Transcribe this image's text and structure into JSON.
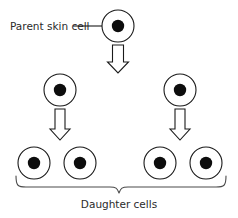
{
  "figure": {
    "title_text": "",
    "width": 238,
    "height": 218,
    "background_color": "#ffffff",
    "stroke_color": "#1a1a1a",
    "nucleus_color": "#0d0d0d",
    "brace_color": "#4a4a4a",
    "text_color": "#2b2b2b"
  },
  "labels": {
    "parent": "Parent skin cell",
    "daughter": "Daughter cells"
  },
  "cells": {
    "parent": {
      "cx": 118,
      "cy": 26,
      "r": 16,
      "nucleus_r": 6.2
    },
    "generation_two": [
      {
        "cx": 60,
        "cy": 90,
        "r": 16,
        "nucleus_r": 6.2
      },
      {
        "cx": 180,
        "cy": 90,
        "r": 16,
        "nucleus_r": 6.2
      }
    ],
    "generation_three": [
      {
        "cx": 34,
        "cy": 163,
        "r": 16,
        "nucleus_r": 6.2
      },
      {
        "cx": 80,
        "cy": 163,
        "r": 16,
        "nucleus_r": 6.2
      },
      {
        "cx": 160,
        "cy": 163,
        "r": 16,
        "nucleus_r": 6.2
      },
      {
        "cx": 206,
        "cy": 163,
        "r": 16,
        "nucleus_r": 6.2
      }
    ]
  },
  "arrows": [
    {
      "name": "parent-to-generation-two",
      "cx": 118,
      "y_top": 45,
      "y_bottom": 73
    },
    {
      "name": "generation-two-left-to-daughters",
      "cx": 60,
      "y_top": 109,
      "y_bottom": 140
    },
    {
      "name": "generation-two-right-to-daughters",
      "cx": 180,
      "y_top": 109,
      "y_bottom": 140
    }
  ],
  "leader_line": {
    "x1": 73,
    "x2": 102,
    "y": 26
  },
  "brace": {
    "x_left": 16,
    "x_right": 226,
    "y_top": 178,
    "y_bottom": 193,
    "center_x": 119
  },
  "text_positions": {
    "parent_label": {
      "x": 10,
      "y": 30
    },
    "daughter_label": {
      "x": 119,
      "y": 208
    }
  }
}
